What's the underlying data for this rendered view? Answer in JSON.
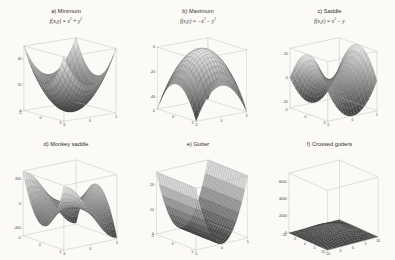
{
  "figure": {
    "background": "#fbfaf7",
    "rows": 2,
    "cols": 3,
    "colormap": "gray",
    "surface_light": "#e8e8e8",
    "surface_dark": "#4a4a4a",
    "mesh_color": "#6e6e6e",
    "box_color": "#b9b9b9",
    "tick_text_color": "#3a3a3a"
  },
  "panels": [
    {
      "id": "a",
      "label": "a) Minimum",
      "equation_text": "f(x,y) = x² + y²",
      "eq_lhs": "f(x,y)",
      "eq_rhs_terms": [
        "x",
        "y"
      ],
      "eq_signs": [
        "+",
        "+"
      ],
      "surface_type": "paraboloid-up",
      "xlim": [
        -5,
        5
      ],
      "ylim": [
        -5,
        5
      ],
      "zlim": [
        0,
        50
      ],
      "xticks": [
        -5,
        0,
        5
      ],
      "yticks": [
        -5,
        0,
        5
      ],
      "zticks": [
        0,
        20,
        40
      ],
      "xticklabels": [
        "-5",
        "0",
        "5"
      ],
      "yticklabels": [
        "-5",
        "0",
        "5"
      ],
      "zticklabels": [
        "0",
        "20",
        "40"
      ],
      "view_azimuth": -37.5,
      "view_elevation": 12
    },
    {
      "id": "b",
      "label": "b) Maximum",
      "equation_text": "f(x,y) = -x² - y²",
      "eq_lhs": "f(x,y)",
      "eq_rhs_terms": [
        "x",
        "y"
      ],
      "eq_signs": [
        "-",
        "-"
      ],
      "surface_type": "paraboloid-down",
      "xlim": [
        -5,
        5
      ],
      "ylim": [
        -5,
        5
      ],
      "zlim": [
        -50,
        0
      ],
      "xticks": [
        -5,
        0,
        5
      ],
      "yticks": [
        -5,
        0,
        5
      ],
      "zticks": [
        -40,
        -20,
        0
      ],
      "xticklabels": [
        "-5",
        "0",
        "5"
      ],
      "yticklabels": [
        "-5",
        "0",
        "5"
      ],
      "zticklabels": [
        "-40",
        "-20",
        "0"
      ],
      "view_azimuth": -37.5,
      "view_elevation": 14
    },
    {
      "id": "c",
      "label": "c) Saddle",
      "equation_text": "f(x,y) = x² - y²",
      "eq_lhs": "f(x,y)",
      "eq_rhs_terms": [
        "x",
        "y"
      ],
      "eq_signs": [
        "+",
        "-"
      ],
      "surface_type": "saddle",
      "xlim": [
        -5,
        5
      ],
      "ylim": [
        -5,
        5
      ],
      "zlim": [
        -25,
        25
      ],
      "xticks": [
        -5,
        0,
        5
      ],
      "yticks": [
        -5,
        0,
        5
      ],
      "zticks": [
        -20,
        0,
        20
      ],
      "xticklabels": [
        "-5",
        "0",
        "5"
      ],
      "yticklabels": [
        "-5",
        "0",
        "5"
      ],
      "zticklabels": [
        "-20",
        "0",
        "20"
      ],
      "view_azimuth": -37.5,
      "view_elevation": 16
    },
    {
      "id": "d",
      "label": "d) Monkey saddle",
      "equation_text": "",
      "surface_type": "monkey-saddle",
      "xlim": [
        -5,
        5
      ],
      "ylim": [
        -5,
        5
      ],
      "zlim": [
        -260,
        260
      ],
      "xticks": [
        -5,
        0,
        5
      ],
      "yticks": [
        -5,
        0,
        5
      ],
      "zticks": [
        -200,
        0,
        200
      ],
      "xticklabels": [
        "-5",
        "0",
        "5"
      ],
      "yticklabels": [
        "-5",
        "0",
        "5"
      ],
      "zticklabels": [
        "-200",
        "0",
        "200"
      ],
      "view_azimuth": -37.5,
      "view_elevation": 16
    },
    {
      "id": "e",
      "label": "e) Gutter",
      "equation_text": "",
      "surface_type": "gutter",
      "xlim": [
        -5,
        5
      ],
      "ylim": [
        -5,
        5
      ],
      "zlim": [
        0,
        25
      ],
      "xticks": [
        -5,
        0,
        5
      ],
      "yticks": [
        -5,
        0,
        5
      ],
      "zticks": [
        0,
        10,
        20
      ],
      "xticklabels": [
        "-5",
        "0",
        "5"
      ],
      "yticklabels": [
        "-5",
        "0",
        "5"
      ],
      "zticklabels": [
        "0",
        "10",
        "20"
      ],
      "view_azimuth": -37.5,
      "view_elevation": 18
    },
    {
      "id": "f",
      "label": "f) Crossed gutters",
      "equation_text": "",
      "surface_type": "crossed-gutters",
      "xlim": [
        -10,
        10
      ],
      "ylim": [
        -10,
        10
      ],
      "zlim": [
        0,
        7000
      ],
      "xticks": [
        -10,
        -5,
        0,
        5,
        10
      ],
      "yticks": [
        -10,
        -5,
        0,
        5,
        10
      ],
      "zticks": [
        0,
        2000,
        4000,
        6000
      ],
      "xticklabels": [
        "-10",
        "-5",
        "0",
        "5",
        "10"
      ],
      "yticklabels": [
        "-10",
        "-5",
        "0",
        "5",
        "10"
      ],
      "zticklabels": [
        "0",
        "2000",
        "4000",
        "6000"
      ],
      "view_azimuth": -37.5,
      "view_elevation": 20
    }
  ],
  "chart_data": {
    "type": "surface",
    "title": "",
    "subplots": [
      {
        "id": "a",
        "title": "a) Minimum",
        "function": "z = x^2 + y^2",
        "xlabel": "",
        "ylabel": "",
        "zlabel": "",
        "xlim": [
          -5,
          5
        ],
        "ylim": [
          -5,
          5
        ],
        "zlim": [
          0,
          50
        ],
        "xticks": [
          -5,
          0,
          5
        ],
        "yticks": [
          -5,
          0,
          5
        ],
        "zticks": [
          0,
          20,
          40
        ],
        "critical_point": {
          "x": 0,
          "y": 0,
          "z": 0,
          "kind": "minimum"
        },
        "grid": true
      },
      {
        "id": "b",
        "title": "b) Maximum",
        "function": "z = -x^2 - y^2",
        "xlabel": "",
        "ylabel": "",
        "zlabel": "",
        "xlim": [
          -5,
          5
        ],
        "ylim": [
          -5,
          5
        ],
        "zlim": [
          -50,
          0
        ],
        "xticks": [
          -5,
          0,
          5
        ],
        "yticks": [
          -5,
          0,
          5
        ],
        "zticks": [
          -40,
          -20,
          0
        ],
        "critical_point": {
          "x": 0,
          "y": 0,
          "z": 0,
          "kind": "maximum"
        },
        "grid": true
      },
      {
        "id": "c",
        "title": "c) Saddle",
        "function": "z = x^2 - y^2",
        "xlabel": "",
        "ylabel": "",
        "zlabel": "",
        "xlim": [
          -5,
          5
        ],
        "ylim": [
          -5,
          5
        ],
        "zlim": [
          -25,
          25
        ],
        "xticks": [
          -5,
          0,
          5
        ],
        "yticks": [
          -5,
          0,
          5
        ],
        "zticks": [
          -20,
          0,
          20
        ],
        "critical_point": {
          "x": 0,
          "y": 0,
          "z": 0,
          "kind": "saddle"
        },
        "grid": true
      },
      {
        "id": "d",
        "title": "d) Monkey saddle",
        "function": "z = x^3 - 3*x*y^2",
        "xlabel": "",
        "ylabel": "",
        "zlabel": "",
        "xlim": [
          -5,
          5
        ],
        "ylim": [
          -5,
          5
        ],
        "zlim": [
          -260,
          260
        ],
        "xticks": [
          -5,
          0,
          5
        ],
        "yticks": [
          -5,
          0,
          5
        ],
        "zticks": [
          -200,
          0,
          200
        ],
        "critical_point": {
          "x": 0,
          "y": 0,
          "z": 0,
          "kind": "monkey-saddle"
        },
        "grid": true
      },
      {
        "id": "e",
        "title": "e) Gutter",
        "function": "z = x^2",
        "xlabel": "",
        "ylabel": "",
        "zlabel": "",
        "xlim": [
          -5,
          5
        ],
        "ylim": [
          -5,
          5
        ],
        "zlim": [
          0,
          25
        ],
        "xticks": [
          -5,
          0,
          5
        ],
        "yticks": [
          -5,
          0,
          5
        ],
        "zticks": [
          0,
          10,
          20
        ],
        "critical_point": {
          "x": 0,
          "y": null,
          "z": 0,
          "kind": "line-of-minima"
        },
        "grid": true
      },
      {
        "id": "f",
        "title": "f) Crossed gutters",
        "function": "z = x^2*y^2 - 10*(x^2 + y^2) + 200",
        "xlabel": "",
        "ylabel": "",
        "zlabel": "",
        "xlim": [
          -10,
          10
        ],
        "ylim": [
          -10,
          10
        ],
        "zlim": [
          0,
          7000
        ],
        "xticks": [
          -10,
          -5,
          0,
          5,
          10
        ],
        "yticks": [
          -10,
          -5,
          0,
          5,
          10
        ],
        "zticks": [
          0,
          2000,
          4000,
          6000
        ],
        "critical_point": {
          "x": 0,
          "y": 0,
          "z": 0,
          "kind": "crossed-gutters"
        },
        "grid": true
      }
    ]
  }
}
